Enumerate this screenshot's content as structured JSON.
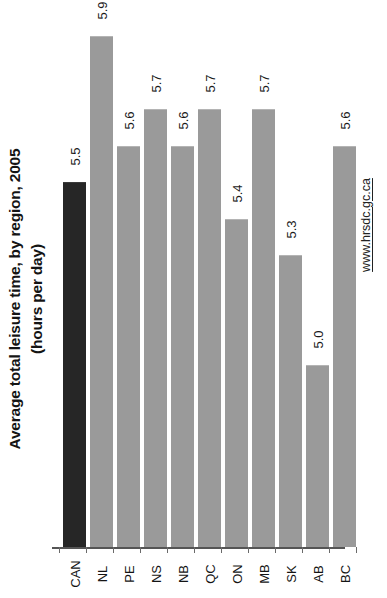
{
  "chart_data": {
    "type": "bar",
    "title": "Average total leisure time, by region, 2005",
    "subtitle": "(hours per day)",
    "xlabel": "",
    "ylabel": "",
    "categories": [
      "CAN",
      "NL",
      "PE",
      "NS",
      "NB",
      "QC",
      "ON",
      "MB",
      "SK",
      "AB",
      "BC"
    ],
    "values": [
      5.5,
      5.9,
      5.6,
      5.7,
      5.6,
      5.7,
      5.4,
      5.7,
      5.3,
      5.0,
      5.6
    ],
    "value_labels": [
      "5.5",
      "5.9",
      "5.6",
      "5.7",
      "5.6",
      "5.7",
      "5.4",
      "5.7",
      "5.3",
      "5.0",
      "5.6"
    ],
    "ylim": [
      4.5,
      6.0
    ],
    "grid": false,
    "legend": "none",
    "orientation": "vertical-rotated-90ccw",
    "highlight_index": 0,
    "colors": {
      "bar": "#9a9a9a",
      "bar_highlight": "#262626",
      "axis": "#555555",
      "text": "#141414"
    }
  },
  "source": {
    "url_text": "www.hrsdc.gc.ca"
  }
}
